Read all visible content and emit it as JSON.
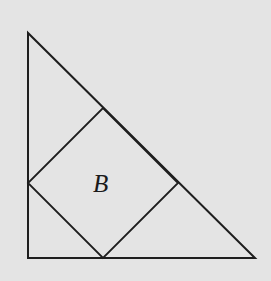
{
  "diagram": {
    "background": "#e4e4e4",
    "stroke_color": "#1e1e1e",
    "triangle": {
      "vertices": [
        [
          28,
          33
        ],
        [
          28,
          258
        ],
        [
          255,
          258
        ]
      ]
    },
    "square": {
      "label": "B",
      "vertices": [
        [
          103,
          108
        ],
        [
          178,
          183
        ],
        [
          103,
          258
        ],
        [
          28,
          183
        ]
      ]
    }
  }
}
